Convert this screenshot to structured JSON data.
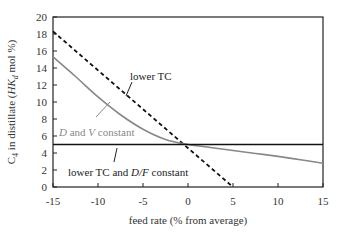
{
  "chart_data": {
    "type": "line",
    "title": "",
    "xlabel": "feed rate (% from average)",
    "ylabel": {
      "prefix": "C",
      "prefix_sub": "4",
      "middle": " in distillate (",
      "italic": "HK",
      "italic_sub": "d",
      "suffix": " mol %)"
    },
    "xlim": [
      -15,
      15
    ],
    "ylim": [
      0,
      20
    ],
    "xticks": [
      -15,
      -10,
      -5,
      0,
      5,
      10,
      15
    ],
    "yticks": [
      0,
      2,
      4,
      6,
      8,
      10,
      12,
      14,
      16,
      18,
      20
    ],
    "grid": false,
    "legend": "none (inline annotations)",
    "series": [
      {
        "name": "lower TC",
        "style": "dashed",
        "color": "#111111",
        "x": [
          -15,
          5
        ],
        "y": [
          18.3,
          0
        ]
      },
      {
        "name": "D and V constant",
        "style": "solid",
        "color": "#888888",
        "x": [
          -15,
          -12.5,
          -10,
          -7.5,
          -5,
          -2.5,
          0,
          2.5,
          5,
          7.5,
          10,
          12.5,
          15
        ],
        "y": [
          15.3,
          13.0,
          10.6,
          8.5,
          6.8,
          5.6,
          5.0,
          4.65,
          4.3,
          3.95,
          3.6,
          3.2,
          2.8
        ]
      },
      {
        "name": "lower TC and D/F constant",
        "style": "solid",
        "color": "#111111",
        "x": [
          -15,
          15
        ],
        "y": [
          5.0,
          5.0
        ]
      }
    ],
    "annotations": [
      {
        "text": "lower TC",
        "target_series": 0
      },
      {
        "text_parts": [
          "D",
          " and ",
          "V",
          " constant"
        ],
        "italic_indices": [
          0,
          2
        ],
        "target_series": 1
      },
      {
        "text_parts": [
          "lower TC and ",
          "D/F",
          " constant"
        ],
        "italic_indices": [
          1
        ],
        "target_series": 2
      }
    ]
  },
  "labels": {
    "xlabel": "feed rate (% from average)",
    "annot_lower_tc": "lower TC",
    "annot_dv_1": "D",
    "annot_dv_2": " and ",
    "annot_dv_3": "V",
    "annot_dv_4": " constant",
    "annot_df_1": "lower TC and ",
    "annot_df_2": "D/F",
    "annot_df_3": " constant",
    "ylabel_c": "C",
    "ylabel_c_sub": "4",
    "ylabel_mid": " in distillate (",
    "ylabel_hk": "HK",
    "ylabel_hk_sub": "d",
    "ylabel_end": " mol %)"
  }
}
